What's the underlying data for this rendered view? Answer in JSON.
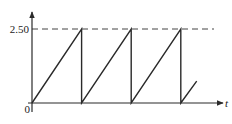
{
  "chart_data": {
    "type": "line",
    "title": "",
    "xlabel": "t",
    "ylabel": "",
    "y_ticks": [
      "0",
      "2.50"
    ],
    "x_ticks": [],
    "ylim": [
      0,
      2.5
    ],
    "reference_lines": [
      {
        "y": 2.5,
        "style": "dashed",
        "label": "2.50"
      }
    ],
    "period_count_full": 3,
    "series": [
      {
        "name": "sawtooth",
        "points": [
          {
            "x": 0,
            "y": 0
          },
          {
            "x": 1,
            "y": 2.5
          },
          {
            "x": 1,
            "y": 0
          },
          {
            "x": 2,
            "y": 2.5
          },
          {
            "x": 2,
            "y": 0
          },
          {
            "x": 3,
            "y": 2.5
          },
          {
            "x": 3,
            "y": 0
          },
          {
            "x": 3.32,
            "y": 0.74
          }
        ]
      }
    ],
    "grid": false,
    "legend": false
  },
  "labels": {
    "origin": "0",
    "ymax": "2.50",
    "xaxis": "t"
  },
  "colors": {
    "line": "#2a2a2a",
    "axis": "#2a2a2a",
    "dashed": "#444444"
  }
}
